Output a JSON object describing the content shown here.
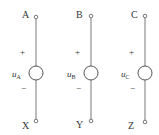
{
  "diagram": {
    "type": "three-phase voltage sources",
    "sources": [
      {
        "id": "A",
        "top_label": "A",
        "bottom_label": "X",
        "plus": "+",
        "minus": "−",
        "var": "u",
        "sub": "A",
        "x": 36
      },
      {
        "id": "B",
        "top_label": "B",
        "bottom_label": "Y",
        "plus": "+",
        "minus": "−",
        "var": "u",
        "sub": "B",
        "x": 91
      },
      {
        "id": "C",
        "top_label": "C",
        "bottom_label": "Z",
        "plus": "+",
        "minus": "−",
        "var": "u",
        "sub": "C",
        "x": 145
      }
    ],
    "colors": {
      "line": "#555555",
      "text": "#333333",
      "background": "#ffffff"
    }
  }
}
